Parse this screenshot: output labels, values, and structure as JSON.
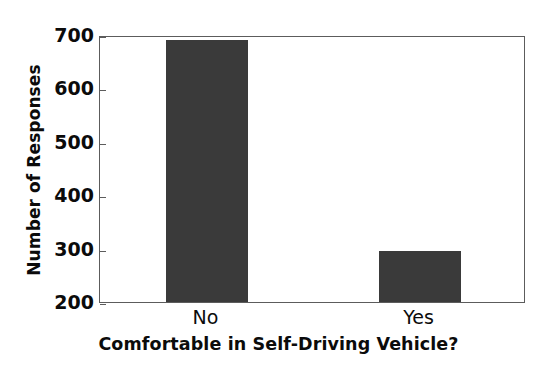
{
  "chart_data": {
    "type": "bar",
    "title": "",
    "subtitle": "",
    "categories": [
      "No",
      "Yes"
    ],
    "values": [
      690,
      295
    ],
    "series": [
      {
        "name": "Number of Responses",
        "values": [
          690,
          295
        ]
      }
    ],
    "xlabel": "Comfortable in Self-Driving Vehicle?",
    "ylabel": "Number of Responses",
    "ylim": [
      200,
      700
    ],
    "ytick_labels": [
      "700",
      "600",
      "500",
      "400",
      "300",
      "200"
    ],
    "ytick_values": [
      700,
      600,
      500,
      400,
      300,
      200
    ],
    "ytick_step": 100,
    "grid": false,
    "legend": false,
    "legend_position": "none",
    "bar_color": "#3a3a3a",
    "axis_color": "#5c5c5c",
    "background_color": "#ffffff",
    "text_color": "#0b0b0b",
    "annotations": []
  }
}
